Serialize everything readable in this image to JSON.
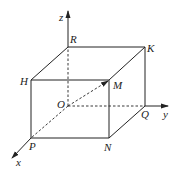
{
  "diagram": {
    "type": "3d-coordinate-cuboid",
    "axes": {
      "x": {
        "label": "x"
      },
      "y": {
        "label": "y"
      },
      "z": {
        "label": "z"
      }
    },
    "points": {
      "O": {
        "label": "O"
      },
      "R": {
        "label": "R"
      },
      "K": {
        "label": "K"
      },
      "H": {
        "label": "H"
      },
      "M": {
        "label": "M"
      },
      "Q": {
        "label": "Q"
      },
      "P": {
        "label": "P"
      },
      "N": {
        "label": "N"
      }
    },
    "solid_edges": [
      "R-K",
      "R-H",
      "K-M",
      "H-M",
      "H-P",
      "M-N",
      "K-Q",
      "P-N",
      "N-Q"
    ],
    "dashed_edges": [
      "O-R",
      "O-Q",
      "O-P",
      "O-M"
    ],
    "vectors": [
      "O->M"
    ],
    "colors": {
      "line": "#222222",
      "background": "#ffffff"
    }
  }
}
